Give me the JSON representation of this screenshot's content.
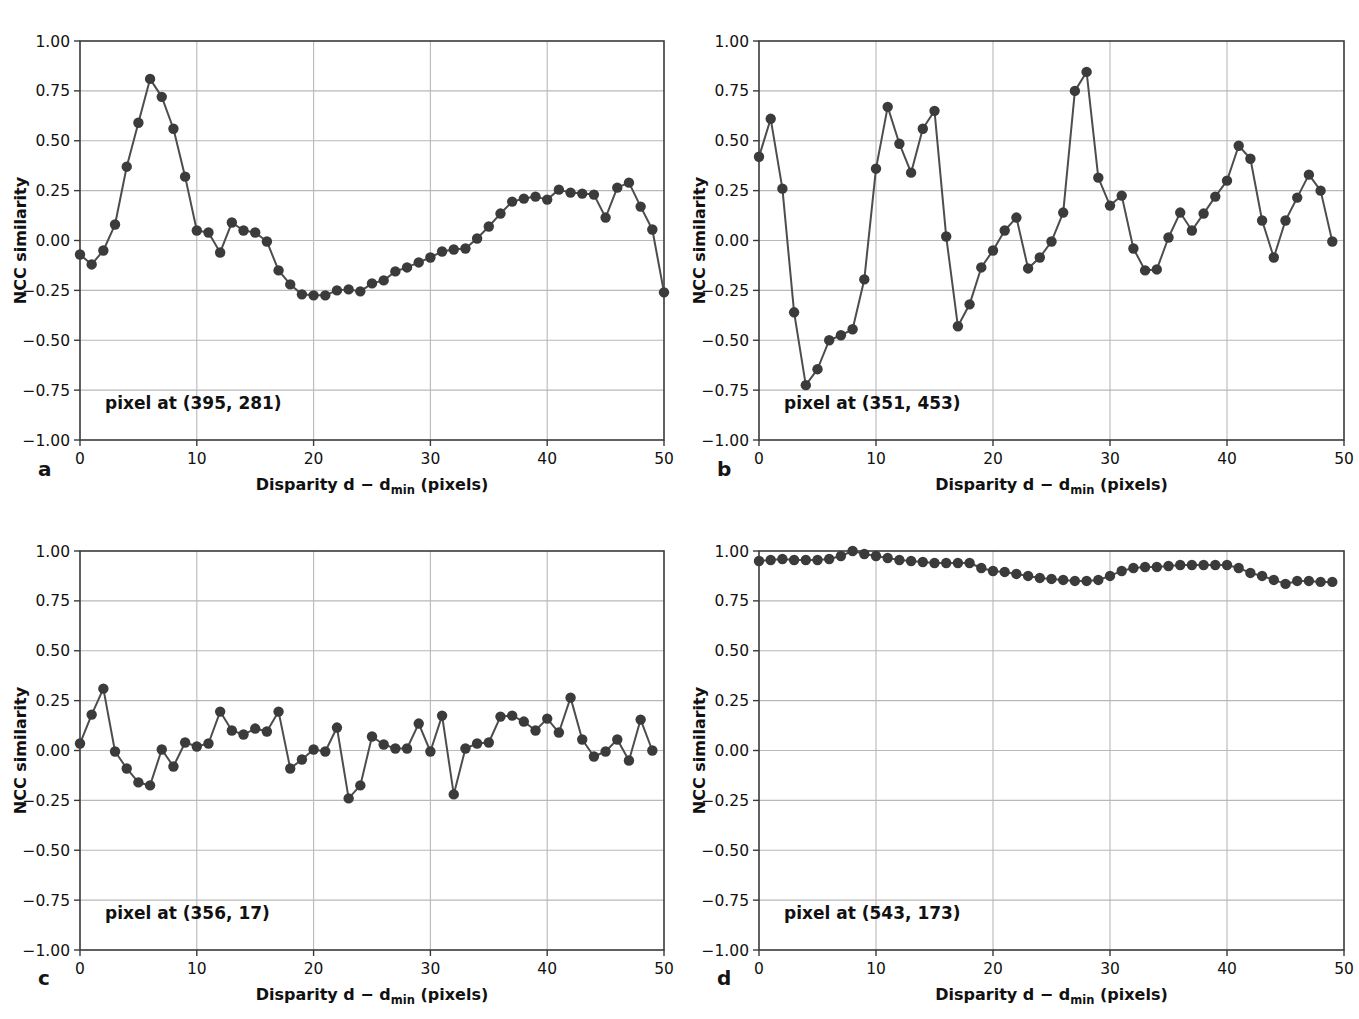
{
  "figure": {
    "background": "#ffffff",
    "marker_color": "#3b3b3b",
    "line_color": "#4d4d4d",
    "grid_color": "#b9b9b9",
    "axis_color": "#3a3a3a",
    "panel_letters": [
      "a",
      "b",
      "c",
      "d"
    ]
  },
  "common": {
    "xlabel_main": "Disparity d − d",
    "xlabel_sub": "min",
    "xlabel_tail": " (pixels)",
    "ylabel": "NCC similarity",
    "xticks": [
      "0",
      "10",
      "20",
      "30",
      "40",
      "50"
    ],
    "xtick_values": [
      0,
      10,
      20,
      30,
      40,
      50
    ],
    "yticks": [
      "1.00",
      "0.75",
      "0.50",
      "0.25",
      "0.00",
      "−0.25",
      "−0.50",
      "−0.75",
      "−1.00"
    ],
    "ytick_values": [
      1.0,
      0.75,
      0.5,
      0.25,
      0.0,
      -0.25,
      -0.5,
      -0.75,
      -1.0
    ],
    "xlim": [
      0,
      50
    ],
    "ylim": [
      -1.0,
      1.0
    ]
  },
  "chart_data": [
    {
      "id": "panel-a",
      "letter": "a",
      "type": "line",
      "title": "",
      "annotation": "pixel at (395, 281)",
      "xlabel": "Disparity d − dmin (pixels)",
      "ylabel": "NCC similarity",
      "xlim": [
        0,
        50
      ],
      "ylim": [
        -1.0,
        1.0
      ],
      "grid": true,
      "legend": "none",
      "x": [
        0,
        1,
        2,
        3,
        4,
        5,
        6,
        7,
        8,
        9,
        10,
        11,
        12,
        13,
        14,
        15,
        16,
        17,
        18,
        19,
        20,
        21,
        22,
        23,
        24,
        25,
        26,
        27,
        28,
        29,
        30,
        31,
        32,
        33,
        34,
        35,
        36,
        37,
        38,
        39,
        40,
        41,
        42,
        43,
        44,
        45,
        46,
        47,
        48,
        49
      ],
      "values": [
        -0.07,
        -0.12,
        -0.05,
        0.08,
        0.37,
        0.59,
        0.81,
        0.72,
        0.56,
        0.32,
        0.05,
        0.04,
        -0.06,
        0.09,
        0.05,
        0.04,
        -0.005,
        -0.15,
        -0.22,
        -0.27,
        -0.275,
        -0.275,
        -0.25,
        -0.245,
        -0.255,
        -0.215,
        -0.2,
        -0.155,
        -0.135,
        -0.11,
        -0.085,
        -0.055,
        -0.045,
        -0.04,
        0.01,
        0.07,
        0.135,
        0.195,
        0.21,
        0.22,
        0.205,
        0.255,
        0.24,
        0.235,
        0.23,
        0.115,
        0.265,
        0.29,
        0.17,
        0.055,
        -0.26
      ]
    },
    {
      "id": "panel-b",
      "letter": "b",
      "type": "line",
      "title": "",
      "annotation": "pixel at (351, 453)",
      "xlabel": "Disparity d − dmin (pixels)",
      "ylabel": "NCC similarity",
      "xlim": [
        0,
        50
      ],
      "ylim": [
        -1.0,
        1.0
      ],
      "grid": true,
      "legend": "none",
      "x": [
        0,
        1,
        2,
        3,
        4,
        5,
        6,
        7,
        8,
        9,
        10,
        11,
        12,
        13,
        14,
        15,
        16,
        17,
        18,
        19,
        20,
        21,
        22,
        23,
        24,
        25,
        26,
        27,
        28,
        29,
        30,
        31,
        32,
        33,
        34,
        35,
        36,
        37,
        38,
        39,
        40,
        41,
        42,
        43,
        44,
        45,
        46,
        47,
        48,
        49
      ],
      "values": [
        0.42,
        0.61,
        0.26,
        -0.36,
        -0.725,
        -0.645,
        -0.5,
        -0.475,
        -0.445,
        -0.195,
        0.36,
        0.67,
        0.485,
        0.34,
        0.56,
        0.65,
        0.02,
        -0.43,
        -0.32,
        -0.135,
        -0.05,
        0.05,
        0.115,
        -0.14,
        -0.085,
        -0.005,
        0.14,
        0.75,
        0.845,
        0.315,
        0.175,
        0.225,
        -0.04,
        -0.15,
        -0.145,
        0.015,
        0.14,
        0.05,
        0.135,
        0.22,
        0.3,
        0.475,
        0.41,
        0.1,
        -0.085,
        0.1,
        0.215,
        0.33,
        0.25,
        -0.005
      ]
    },
    {
      "id": "panel-c",
      "letter": "c",
      "type": "line",
      "title": "",
      "annotation": "pixel at (356, 17)",
      "xlabel": "Disparity d − dmin (pixels)",
      "ylabel": "NCC similarity",
      "xlim": [
        0,
        50
      ],
      "ylim": [
        -1.0,
        1.0
      ],
      "grid": true,
      "legend": "none",
      "x": [
        0,
        1,
        2,
        3,
        4,
        5,
        6,
        7,
        8,
        9,
        10,
        11,
        12,
        13,
        14,
        15,
        16,
        17,
        18,
        19,
        20,
        21,
        22,
        23,
        24,
        25,
        26,
        27,
        28,
        29,
        30,
        31,
        32,
        33,
        34,
        35,
        36,
        37,
        38,
        39,
        40,
        41,
        42,
        43,
        44,
        45,
        46,
        47,
        48,
        49
      ],
      "values": [
        0.035,
        0.18,
        0.31,
        -0.005,
        -0.09,
        -0.16,
        -0.175,
        0.005,
        -0.08,
        0.04,
        0.02,
        0.035,
        0.195,
        0.1,
        0.08,
        0.11,
        0.095,
        0.195,
        -0.09,
        -0.045,
        0.005,
        -0.005,
        0.115,
        -0.24,
        -0.175,
        0.07,
        0.03,
        0.01,
        0.01,
        0.135,
        -0.005,
        0.175,
        -0.22,
        0.01,
        0.035,
        0.04,
        0.17,
        0.175,
        0.145,
        0.1,
        0.16,
        0.09,
        0.265,
        0.055,
        -0.03,
        -0.005,
        0.055,
        -0.05,
        0.155,
        0.0
      ]
    },
    {
      "id": "panel-d",
      "letter": "d",
      "type": "line",
      "title": "",
      "annotation": "pixel at (543, 173)",
      "xlabel": "Disparity d − dmin (pixels)",
      "ylabel": "NCC similarity",
      "xlim": [
        0,
        50
      ],
      "ylim": [
        -1.0,
        1.0
      ],
      "grid": true,
      "legend": "none",
      "x": [
        0,
        1,
        2,
        3,
        4,
        5,
        6,
        7,
        8,
        9,
        10,
        11,
        12,
        13,
        14,
        15,
        16,
        17,
        18,
        19,
        20,
        21,
        22,
        23,
        24,
        25,
        26,
        27,
        28,
        29,
        30,
        31,
        32,
        33,
        34,
        35,
        36,
        37,
        38,
        39,
        40,
        41,
        42,
        43,
        44,
        45,
        46,
        47,
        48,
        49
      ],
      "values": [
        0.95,
        0.955,
        0.96,
        0.955,
        0.955,
        0.955,
        0.96,
        0.975,
        1.0,
        0.985,
        0.975,
        0.965,
        0.955,
        0.95,
        0.945,
        0.94,
        0.94,
        0.94,
        0.94,
        0.915,
        0.9,
        0.895,
        0.885,
        0.875,
        0.865,
        0.86,
        0.855,
        0.85,
        0.85,
        0.855,
        0.875,
        0.9,
        0.915,
        0.92,
        0.92,
        0.925,
        0.93,
        0.93,
        0.93,
        0.93,
        0.93,
        0.915,
        0.89,
        0.875,
        0.855,
        0.835,
        0.85,
        0.85,
        0.845,
        0.845
      ]
    }
  ]
}
